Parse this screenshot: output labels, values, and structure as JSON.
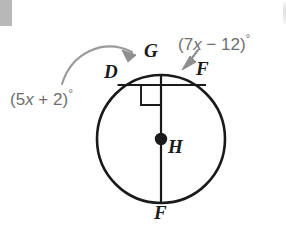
{
  "figure": {
    "type": "circle-geometry-diagram",
    "background_color": "#ffffff",
    "stroke_color": "#1a1a1a",
    "annotation_color": "#6e6e6e",
    "circle": {
      "center_label": "H",
      "center_x": 161,
      "center_y": 139,
      "radius": 64
    },
    "points": [
      {
        "label": "G",
        "x": 150,
        "y": 52,
        "position": "top of circle"
      },
      {
        "label": "D",
        "x": 110,
        "y": 72,
        "position": "upper left on circle"
      },
      {
        "label": "F",
        "x": 198,
        "y": 70,
        "position": "upper right on circle"
      },
      {
        "label": "F",
        "x": 158,
        "y": 212,
        "position": "bottom of circle"
      },
      {
        "label": "H",
        "x": 170,
        "y": 143,
        "position": "center of circle"
      }
    ],
    "segments": [
      {
        "name": "vertical-diameter",
        "from": "G",
        "to": "F",
        "x1": 161,
        "y1": 75,
        "x2": 161,
        "y2": 203
      },
      {
        "name": "horizontal-chord",
        "from": "D",
        "to": "F",
        "x1": 118,
        "y1": 85,
        "x2": 206,
        "y2": 85
      }
    ],
    "right_angle": {
      "name": "right-angle-marker",
      "at_x": 161,
      "at_y": 85,
      "size": 20
    },
    "annotations": [
      {
        "name": "arc-measure-left",
        "text_plain": "(5x + 2)°",
        "prefix": "(5",
        "variable": "x",
        "suffix": " + 2)",
        "degree": "°",
        "x": 8,
        "y": 90,
        "points_to": "arc DG"
      },
      {
        "name": "arc-measure-right",
        "text_plain": "(7x − 12)°",
        "prefix": "(7",
        "variable": "x",
        "suffix": " − 12)",
        "degree": "°",
        "x": 178,
        "y": 35,
        "points_to": "arc GF"
      }
    ],
    "arrows": [
      {
        "name": "curved-arrow-left",
        "from_label": "(5x + 2)°",
        "to": "arc between D and G"
      },
      {
        "name": "straight-arrow-right",
        "from_label": "(7x − 12)°",
        "to": "arc between G and F"
      }
    ]
  }
}
